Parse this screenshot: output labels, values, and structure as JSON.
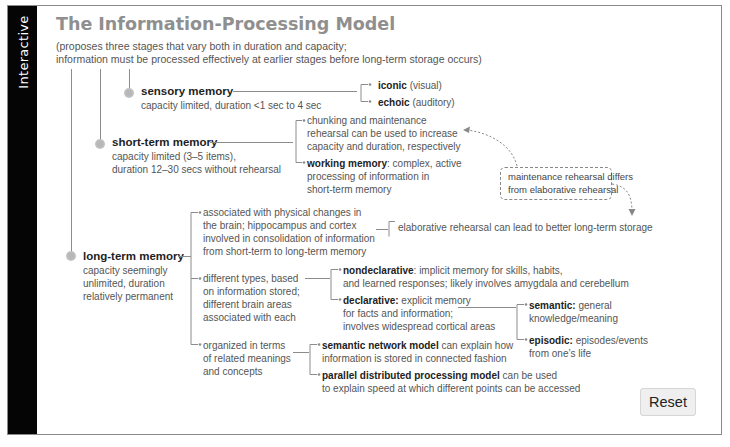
{
  "sidebar": {
    "label": "Interactive"
  },
  "header": {
    "title": "The Information-Processing Model",
    "subtitle_line1": "(proposes three stages that vary both in duration and capacity;",
    "subtitle_line2": "information must be processed effectively at earlier stages before long-term storage occurs)"
  },
  "stages": {
    "sensory": {
      "name": "sensory memory",
      "desc": "capacity limited, duration <1 sec to 4 sec",
      "branches": [
        {
          "bold": "iconic",
          "text": " (visual)"
        },
        {
          "bold": "echoic",
          "text": " (auditory)"
        }
      ]
    },
    "short_term": {
      "name": "short-term memory",
      "desc_line1": "capacity limited (3–5 items),",
      "desc_line2": "duration 12–30 secs without rehearsal",
      "branches": [
        {
          "lines": [
            "chunking and maintenance",
            "rehearsal can be used to increase",
            "capacity and duration, respectively"
          ]
        },
        {
          "bold": "working memory",
          "text": ": complex, active",
          "lines": [
            "processing of information in",
            "short-term memory"
          ]
        }
      ]
    },
    "long_term": {
      "name": "long-term memory",
      "desc_line1": "capacity seemingly",
      "desc_line2": "unlimited, duration",
      "desc_line3": "relatively permanent",
      "branches": [
        {
          "lines": [
            "associated with physical changes in",
            "the brain; hippocampus and cortex",
            "involved in consolidation of information",
            "from short-term to long-term memory"
          ]
        },
        {
          "lines": [
            "different types, based",
            "on information stored;",
            "different brain areas",
            "associated with each"
          ]
        },
        {
          "lines": [
            "organized in terms",
            "of related meanings",
            "and concepts"
          ]
        }
      ],
      "elaborative": "elaborative rehearsal can lead to better long-term storage",
      "types": {
        "nondeclarative": {
          "bold": "nondeclarative",
          "text": ": implicit memory for skills, habits,",
          "line2": "and learned responses; likely involves amygdala and cerebellum"
        },
        "declarative": {
          "bold": "declarative:",
          "text": " explicit memory",
          "line2": "for facts and information;",
          "line3": "involves widespread cortical areas"
        },
        "semantic": {
          "bold": "semantic:",
          "text": " general",
          "line2": "knowledge/meaning"
        },
        "episodic": {
          "bold": "episodic:",
          "text": " episodes/events",
          "line2": "from one’s life"
        }
      },
      "models": {
        "semantic_network": {
          "bold": "semantic network model",
          "text": " can explain how",
          "line2": "information is stored in connected fashion"
        },
        "pdp": {
          "bold": "parallel distributed processing model",
          "text": " can be used",
          "line2": "to explain speed at which different points can be accessed"
        }
      }
    }
  },
  "callout": {
    "line1": "maintenance rehearsal differs",
    "line2": "from elaborative rehearsal"
  },
  "buttons": {
    "reset": "Reset"
  },
  "colors": {
    "sidebar": "#050505",
    "title": "#8f8f8f",
    "lines": "#8c8c8c",
    "dot": "#b8b8b8"
  }
}
